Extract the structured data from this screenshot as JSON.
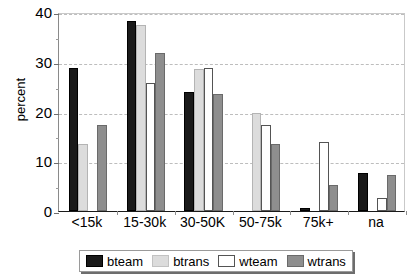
{
  "chart_data": {
    "type": "bar",
    "title": "",
    "subtitle": "",
    "xlabel": "",
    "ylabel": "percent",
    "ylim": [
      0,
      40
    ],
    "ytick_labels": [
      "0",
      "10",
      "20",
      "30",
      "40"
    ],
    "ytick_values": [
      0,
      10,
      20,
      30,
      40
    ],
    "yminor_values": [
      5,
      15,
      25,
      35
    ],
    "grid": "horizontal-dashed",
    "legend_position": "bottom-center",
    "categories": [
      "<15k",
      "15-30k",
      "30-50K",
      "50-75k",
      "75k+",
      "na"
    ],
    "series": [
      {
        "name": "bteam",
        "color": "#1a1a1a",
        "values": [
          28.7,
          38.2,
          23.9,
          0.0,
          0.6,
          7.6
        ]
      },
      {
        "name": "btrans",
        "color": "#dcdcdc",
        "values": [
          13.5,
          37.3,
          28.6,
          19.8,
          0.0,
          0.0
        ]
      },
      {
        "name": "wteam",
        "color": "#ffffff",
        "values": [
          0.0,
          25.7,
          28.8,
          17.2,
          13.9,
          2.6
        ]
      },
      {
        "name": "wtrans",
        "color": "#8e8e8e",
        "values": [
          17.3,
          31.7,
          23.6,
          13.4,
          5.3,
          7.3
        ]
      }
    ]
  },
  "legend": {
    "entries": [
      {
        "label": "bteam",
        "swatch": "black-swatch"
      },
      {
        "label": "btrans",
        "swatch": "light-gray-swatch"
      },
      {
        "label": "wteam",
        "swatch": "white-swatch"
      },
      {
        "label": "wtrans",
        "swatch": "dark-gray-swatch"
      }
    ]
  },
  "colors": {
    "bteam": "#1a1a1a",
    "btrans": "#dcdcdc",
    "wteam": "#ffffff",
    "wtrans": "#8e8e8e",
    "gridline": "#bdbdbd",
    "axis": "#1a1a1a",
    "background": "#ffffff"
  }
}
